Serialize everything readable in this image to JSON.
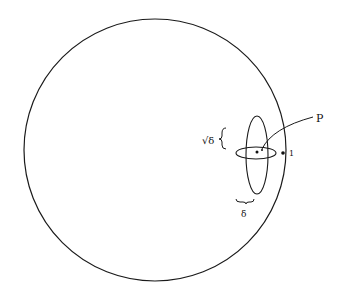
{
  "figure": {
    "background": "#ffffff",
    "stroke": "#1a1a1a",
    "big_circle": {
      "cx": 155,
      "cy": 150,
      "r": 131
    },
    "horizontal_ellipse": {
      "cx": 256,
      "cy": 153,
      "rx": 20,
      "ry": 6
    },
    "vertical_ellipse": {
      "cx": 257,
      "cy": 155,
      "rx": 11,
      "ry": 39
    },
    "point_one": {
      "x": 283,
      "y": 153
    },
    "center_point": {
      "x": 257,
      "y": 153
    },
    "p_point": {
      "x": 262,
      "y": 150
    }
  },
  "labels": {
    "p": "P",
    "one": "1",
    "sqrt_delta": "√δ",
    "delta": "δ"
  }
}
